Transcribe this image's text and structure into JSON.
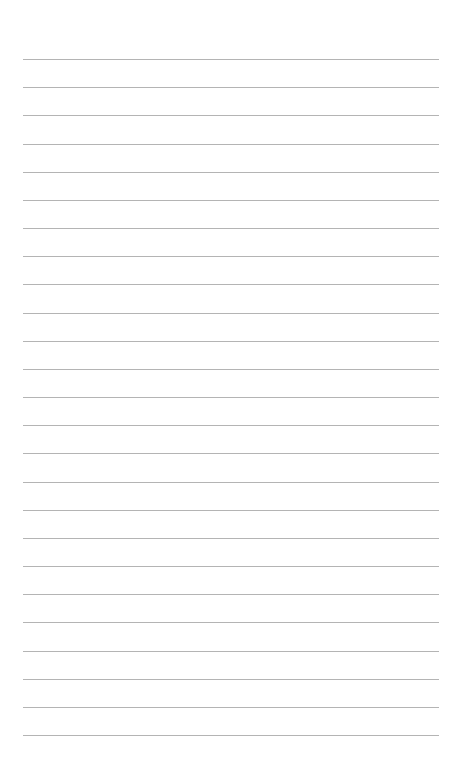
{
  "page": {
    "type": "lined-paper",
    "background_color": "#ffffff",
    "line_color": "#b4b4b4",
    "line_count": 25,
    "first_line_y": 59,
    "line_spacing": 28.17,
    "line_left": 23,
    "line_width": 416
  }
}
